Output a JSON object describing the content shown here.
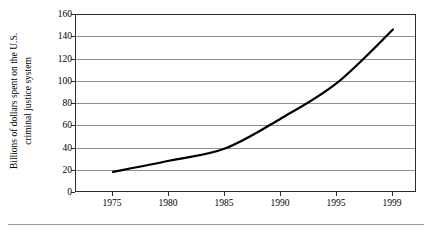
{
  "chart_data": {
    "type": "line",
    "title": "",
    "subtitle": "",
    "xlabel": "",
    "ylabel": "Billions of dollars spent on the U.S. criminal justice system",
    "ylabel_lines": [
      "Billions of dollars spent on the U.S.",
      "criminal justice system"
    ],
    "x": [
      1975,
      1980,
      1985,
      1990,
      1995,
      1999
    ],
    "categories": [
      "1975",
      "1980",
      "1985",
      "1990",
      "1995",
      "1999"
    ],
    "xtick_labels": [
      "1975",
      "1980",
      "1985",
      "1990",
      "1995",
      "1999"
    ],
    "ytick_labels": [
      "0",
      "20",
      "40",
      "60",
      "80",
      "100",
      "120",
      "140",
      "160"
    ],
    "ytick_values": [
      0,
      20,
      40,
      60,
      80,
      100,
      120,
      140,
      160
    ],
    "ylim": [
      0,
      160
    ],
    "xlim": [
      1975,
      1999
    ],
    "grid": "horizontal",
    "legend": "none",
    "series": [
      {
        "name": "U.S. criminal justice system spending",
        "units": "billions of dollars",
        "values": [
          19,
          29,
          40,
          67,
          99,
          147
        ],
        "points": [
          {
            "x": 1975,
            "y": 19
          },
          {
            "x": 1980,
            "y": 29
          },
          {
            "x": 1985,
            "y": 40
          },
          {
            "x": 1990,
            "y": 67
          },
          {
            "x": 1995,
            "y": 99
          },
          {
            "x": 1999,
            "y": 147
          }
        ],
        "color": "#000000",
        "line_width": 2.2,
        "markers": "none"
      }
    ],
    "annotations": []
  },
  "figure": {
    "axis_color": "#2b2b2b",
    "grid_color": "#909090",
    "background": "#ffffff",
    "line_color": "#000000"
  }
}
